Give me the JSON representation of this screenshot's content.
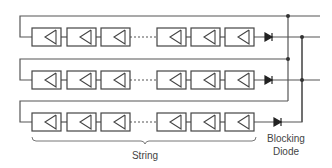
{
  "diagram": {
    "type": "solar PV array with parallel strings and blocking diodes",
    "strings_count": 3,
    "modules_visible_per_string": 6,
    "labels": {
      "string": "String",
      "blocking_diode_line1": "Blocking",
      "blocking_diode_line2": "Diode"
    },
    "colors": {
      "line": "#555555",
      "module_stroke": "#444444",
      "diode": "#222222"
    }
  }
}
